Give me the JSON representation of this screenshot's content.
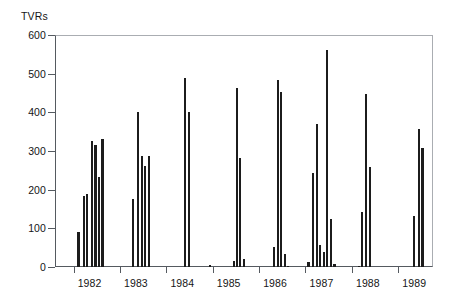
{
  "chart_data": {
    "type": "bar",
    "title": "",
    "ylabel": "TVRs",
    "xlabel": "",
    "ylim": [
      0,
      600
    ],
    "yticks": [
      0,
      100,
      200,
      300,
      400,
      500,
      600
    ],
    "ytick_labels": [
      "0",
      "100",
      "200",
      "300",
      "400",
      "500",
      "600"
    ],
    "xtick_labels": [
      "1982",
      "1983",
      "1984",
      "1985",
      "1986",
      "1987",
      "1988",
      "1989"
    ],
    "xlim": [
      1981.6,
      1989.75
    ],
    "grid": false,
    "legend": null,
    "bar_color": "#1c1c1c",
    "axis_color": "#555a60",
    "series": [
      {
        "name": "TVRs",
        "points": [
          {
            "x": 1982.08,
            "value": 90
          },
          {
            "x": 1982.2,
            "value": 183
          },
          {
            "x": 1982.27,
            "value": 189
          },
          {
            "x": 1982.37,
            "value": 327
          },
          {
            "x": 1982.45,
            "value": 315
          },
          {
            "x": 1982.52,
            "value": 233
          },
          {
            "x": 1982.6,
            "value": 331
          },
          {
            "x": 1983.26,
            "value": 176
          },
          {
            "x": 1983.36,
            "value": 401
          },
          {
            "x": 1983.45,
            "value": 287
          },
          {
            "x": 1983.52,
            "value": 261
          },
          {
            "x": 1983.6,
            "value": 288
          },
          {
            "x": 1984.38,
            "value": 490
          },
          {
            "x": 1984.47,
            "value": 402
          },
          {
            "x": 1984.92,
            "value": 4
          },
          {
            "x": 1985.44,
            "value": 16
          },
          {
            "x": 1985.5,
            "value": 463
          },
          {
            "x": 1985.57,
            "value": 281
          },
          {
            "x": 1985.65,
            "value": 20
          },
          {
            "x": 1986.3,
            "value": 52
          },
          {
            "x": 1986.39,
            "value": 484
          },
          {
            "x": 1986.45,
            "value": 452
          },
          {
            "x": 1986.53,
            "value": 33
          },
          {
            "x": 1986.6,
            "value": 3
          },
          {
            "x": 1987.04,
            "value": 14
          },
          {
            "x": 1987.14,
            "value": 243
          },
          {
            "x": 1987.22,
            "value": 369
          },
          {
            "x": 1987.29,
            "value": 56
          },
          {
            "x": 1987.38,
            "value": 40
          },
          {
            "x": 1987.44,
            "value": 561
          },
          {
            "x": 1987.52,
            "value": 123
          },
          {
            "x": 1987.6,
            "value": 9
          },
          {
            "x": 1988.13,
            "value": 3
          },
          {
            "x": 1988.2,
            "value": 143
          },
          {
            "x": 1988.28,
            "value": 447
          },
          {
            "x": 1988.36,
            "value": 258
          },
          {
            "x": 1989.32,
            "value": 133
          },
          {
            "x": 1989.42,
            "value": 357
          },
          {
            "x": 1989.5,
            "value": 309
          }
        ]
      }
    ]
  }
}
